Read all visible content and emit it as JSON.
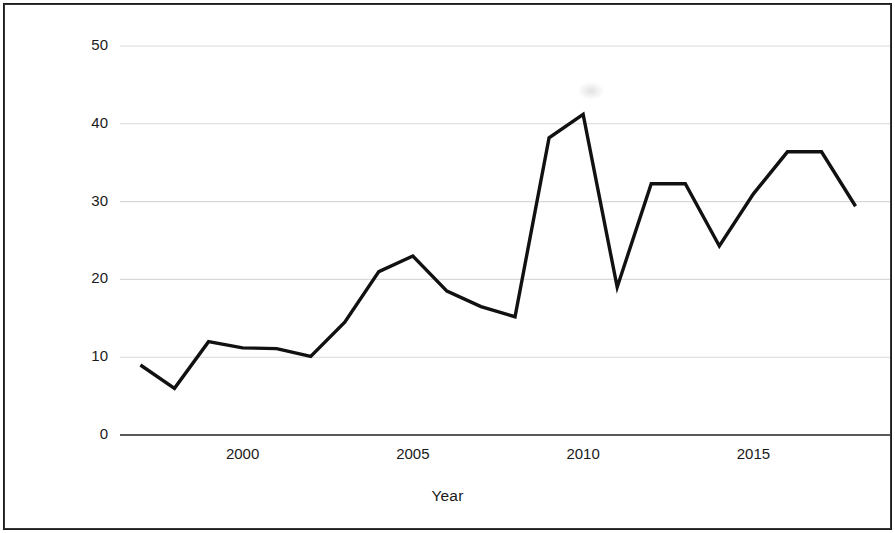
{
  "chart_data": {
    "type": "line",
    "title": "",
    "xlabel": "Year",
    "ylabel": "Number of Policy Memoranda",
    "xlim": [
      1996.4,
      2018.6
    ],
    "ylim": [
      0,
      52
    ],
    "grid": true,
    "legend": "none",
    "line_color": "#111111",
    "gridline_color": "#d9d9d9",
    "axis_color": "#595959",
    "x": [
      1997,
      1998,
      1999,
      2000,
      2001,
      2002,
      2003,
      2004,
      2005,
      2006,
      2007,
      2008,
      2009,
      2010,
      2011,
      2012,
      2013,
      2014,
      2015,
      2016,
      2017,
      2018
    ],
    "values": [
      9,
      6,
      12,
      11.2,
      11.1,
      10.1,
      14.5,
      21,
      23,
      18.5,
      16.5,
      15.2,
      38.2,
      41.2,
      19,
      32.3,
      32.3,
      24.3,
      31,
      36.4,
      36.4,
      29.4
    ],
    "series": [
      {
        "name": "Number of Policy Memoranda",
        "values": [
          9,
          6,
          12,
          11.2,
          11.1,
          10.1,
          14.5,
          21,
          23,
          18.5,
          16.5,
          15.2,
          38.2,
          41.2,
          19,
          32.3,
          32.3,
          24.3,
          31,
          36.4,
          36.4,
          29.4
        ]
      }
    ],
    "ytick_labels": [
      "0",
      "10",
      "20",
      "30",
      "40",
      "50"
    ],
    "ytick_values": [
      0,
      10,
      20,
      30,
      40,
      50
    ],
    "xtick_labels": [
      "2000",
      "2005",
      "2010",
      "2015"
    ],
    "xtick_values": [
      2000,
      2005,
      2010,
      2015
    ]
  }
}
